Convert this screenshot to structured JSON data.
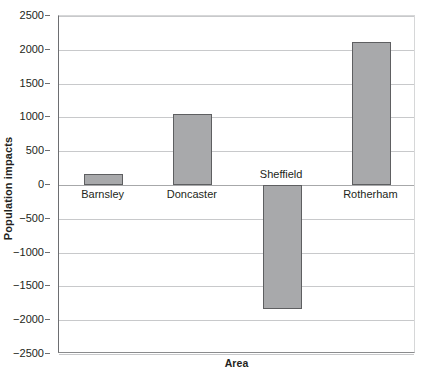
{
  "chart_data": {
    "type": "bar",
    "title": "",
    "xlabel": "Area",
    "ylabel": "Population impacts",
    "categories": [
      "Barnsley",
      "Doncaster",
      "Sheffield",
      "Rotherham"
    ],
    "values": [
      170,
      1050,
      -1830,
      2110
    ],
    "ylim": [
      -2500,
      2500
    ],
    "yticks": [
      2500,
      2000,
      1500,
      1000,
      500,
      0,
      -500,
      -1000,
      -1500,
      -2000,
      -2500
    ],
    "ytick_labels": [
      "2500",
      "2000",
      "1500",
      "1000",
      "500",
      "0",
      "−500",
      "−1000",
      "−1500",
      "−2000",
      "−2500"
    ],
    "grid": true,
    "legend": "none",
    "bar_color": "#a8a9ab",
    "bar_border_color": "#5e5f61",
    "gridline_color": "#c8c9cb",
    "axis_color": "#6d6e71",
    "series": [
      {
        "name": "Population impacts",
        "values": [
          170,
          1050,
          -1830,
          2110
        ]
      }
    ]
  }
}
